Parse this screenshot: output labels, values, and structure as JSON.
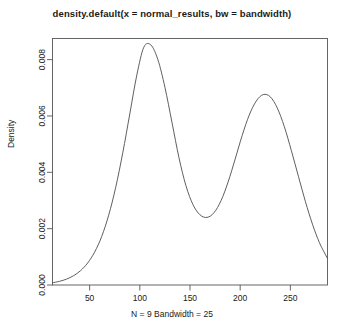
{
  "chart_data": {
    "type": "line",
    "title": "density.default(x = normal_results, bw = bandwidth)",
    "subtitle": "N = 9   Bandwidth = 25",
    "xlabel": "",
    "ylabel": "Density",
    "grid": false,
    "legend": null,
    "xlim": [
      13,
      287
    ],
    "ylim": [
      0,
      0.00875
    ],
    "xticks": [
      50,
      100,
      150,
      200,
      250
    ],
    "xtick_labels": [
      "50",
      "100",
      "150",
      "200",
      "250"
    ],
    "yticks": [
      0.0,
      0.002,
      0.004,
      0.006,
      0.008
    ],
    "ytick_labels": [
      "0.000",
      "0.002",
      "0.004",
      "0.006",
      "0.008"
    ],
    "series": [
      {
        "name": "Density",
        "x": [
          13,
          20,
          27,
          34,
          41,
          48,
          55,
          62,
          69,
          76,
          83,
          90,
          97,
          104,
          111,
          118,
          125,
          132,
          139,
          146,
          153,
          160,
          167,
          174,
          181,
          188,
          195,
          202,
          209,
          216,
          223,
          230,
          237,
          244,
          251,
          258,
          265,
          272,
          279,
          287
        ],
        "values": [
          8e-05,
          0.00013,
          0.00021,
          0.00033,
          0.00051,
          0.00078,
          0.00117,
          0.00172,
          0.00248,
          0.00347,
          0.00469,
          0.00607,
          0.00745,
          0.00844,
          0.00852,
          0.008,
          0.00702,
          0.00578,
          0.00452,
          0.00352,
          0.00285,
          0.00249,
          0.0024,
          0.00257,
          0.003,
          0.00366,
          0.00447,
          0.00531,
          0.00603,
          0.00653,
          0.00676,
          0.00668,
          0.00628,
          0.00562,
          0.00477,
          0.00386,
          0.00296,
          0.00216,
          0.0015,
          0.00094
        ]
      }
    ],
    "peaks": [
      {
        "x": 104,
        "y": 0.00852
      },
      {
        "x": 223,
        "y": 0.00676
      }
    ],
    "valley": {
      "x": 167,
      "y": 0.0024
    },
    "colors": {
      "curve": "#4d4d4d",
      "axis": "#555555",
      "text": "#1a1a1a",
      "background": "#ffffff"
    }
  }
}
